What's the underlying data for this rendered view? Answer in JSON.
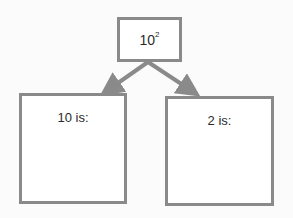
{
  "diagram": {
    "type": "factor-tree",
    "root": {
      "base": "10",
      "exponent": "2"
    },
    "children": [
      {
        "label": "10 is:"
      },
      {
        "label": "2 is:"
      }
    ],
    "colors": {
      "stroke": "#8a8a8a",
      "background": "#fbfbfb",
      "text": "#2a2a2a"
    }
  }
}
